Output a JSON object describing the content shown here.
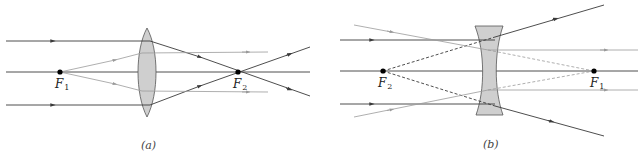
{
  "diagram": {
    "panels": [
      {
        "id": "a",
        "caption": "(a)",
        "lens_type": "converging (convex)",
        "focal_points": [
          {
            "name": "F",
            "subscript": "1",
            "x": 60,
            "y": 72
          },
          {
            "name": "F",
            "subscript": "2",
            "x": 238,
            "y": 72
          }
        ]
      },
      {
        "id": "b",
        "caption": "(b)",
        "lens_type": "diverging (concave)",
        "focal_points": [
          {
            "name": "F",
            "subscript": "2",
            "x": 383,
            "y": 71
          },
          {
            "name": "F",
            "subscript": "1",
            "x": 594,
            "y": 71
          }
        ]
      }
    ],
    "colors": {
      "dark_ray": "#3a3a3a",
      "light_ray": "#9a9a9a",
      "lens_fill": "#cfcfcf",
      "focal_point": "#000000"
    }
  }
}
